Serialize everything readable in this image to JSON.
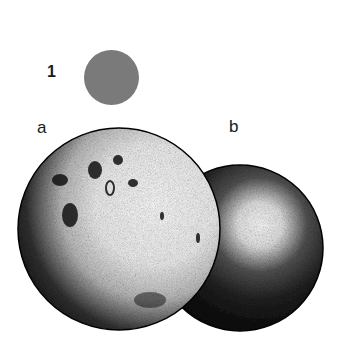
{
  "figure": {
    "number_label": "1",
    "swatch": {
      "color": "#7a7a7a",
      "shape": "circle"
    },
    "spheres": [
      {
        "label": "a",
        "description": "textured sphere with cratered, stippled surface, lit from upper right",
        "base_color": "#000000",
        "highlight_color": "#ffffff"
      },
      {
        "label": "b",
        "description": "smooth stippled sphere with soft specular highlight, partially behind sphere a",
        "base_color": "#000000",
        "highlight_color": "#ffffff"
      }
    ]
  }
}
